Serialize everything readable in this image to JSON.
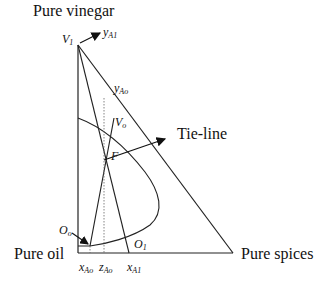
{
  "diagram": {
    "type": "ternary-extraction-diagram",
    "vertices": {
      "top": "Pure vinegar",
      "bottom_left": "Pure oil",
      "bottom_right": "Pure spices"
    },
    "points": {
      "V1": {
        "main": "V",
        "sub": "1"
      },
      "Vo": {
        "main": "V",
        "sub": "o"
      },
      "F": {
        "main": "F",
        "sub": ""
      },
      "Oo": {
        "main": "O",
        "sub": "o"
      },
      "O1": {
        "main": "O",
        "sub": "1"
      }
    },
    "compositions": {
      "yA1": {
        "main": "y",
        "sub": "A1"
      },
      "yAo": {
        "main": "y",
        "sub": "Ao"
      },
      "xAo": {
        "main": "x",
        "sub": "Ao"
      },
      "zAo": {
        "main": "z",
        "sub": "Ao"
      },
      "xA1": {
        "main": "x",
        "sub": "A1"
      }
    },
    "annotation": "Tie-line"
  }
}
